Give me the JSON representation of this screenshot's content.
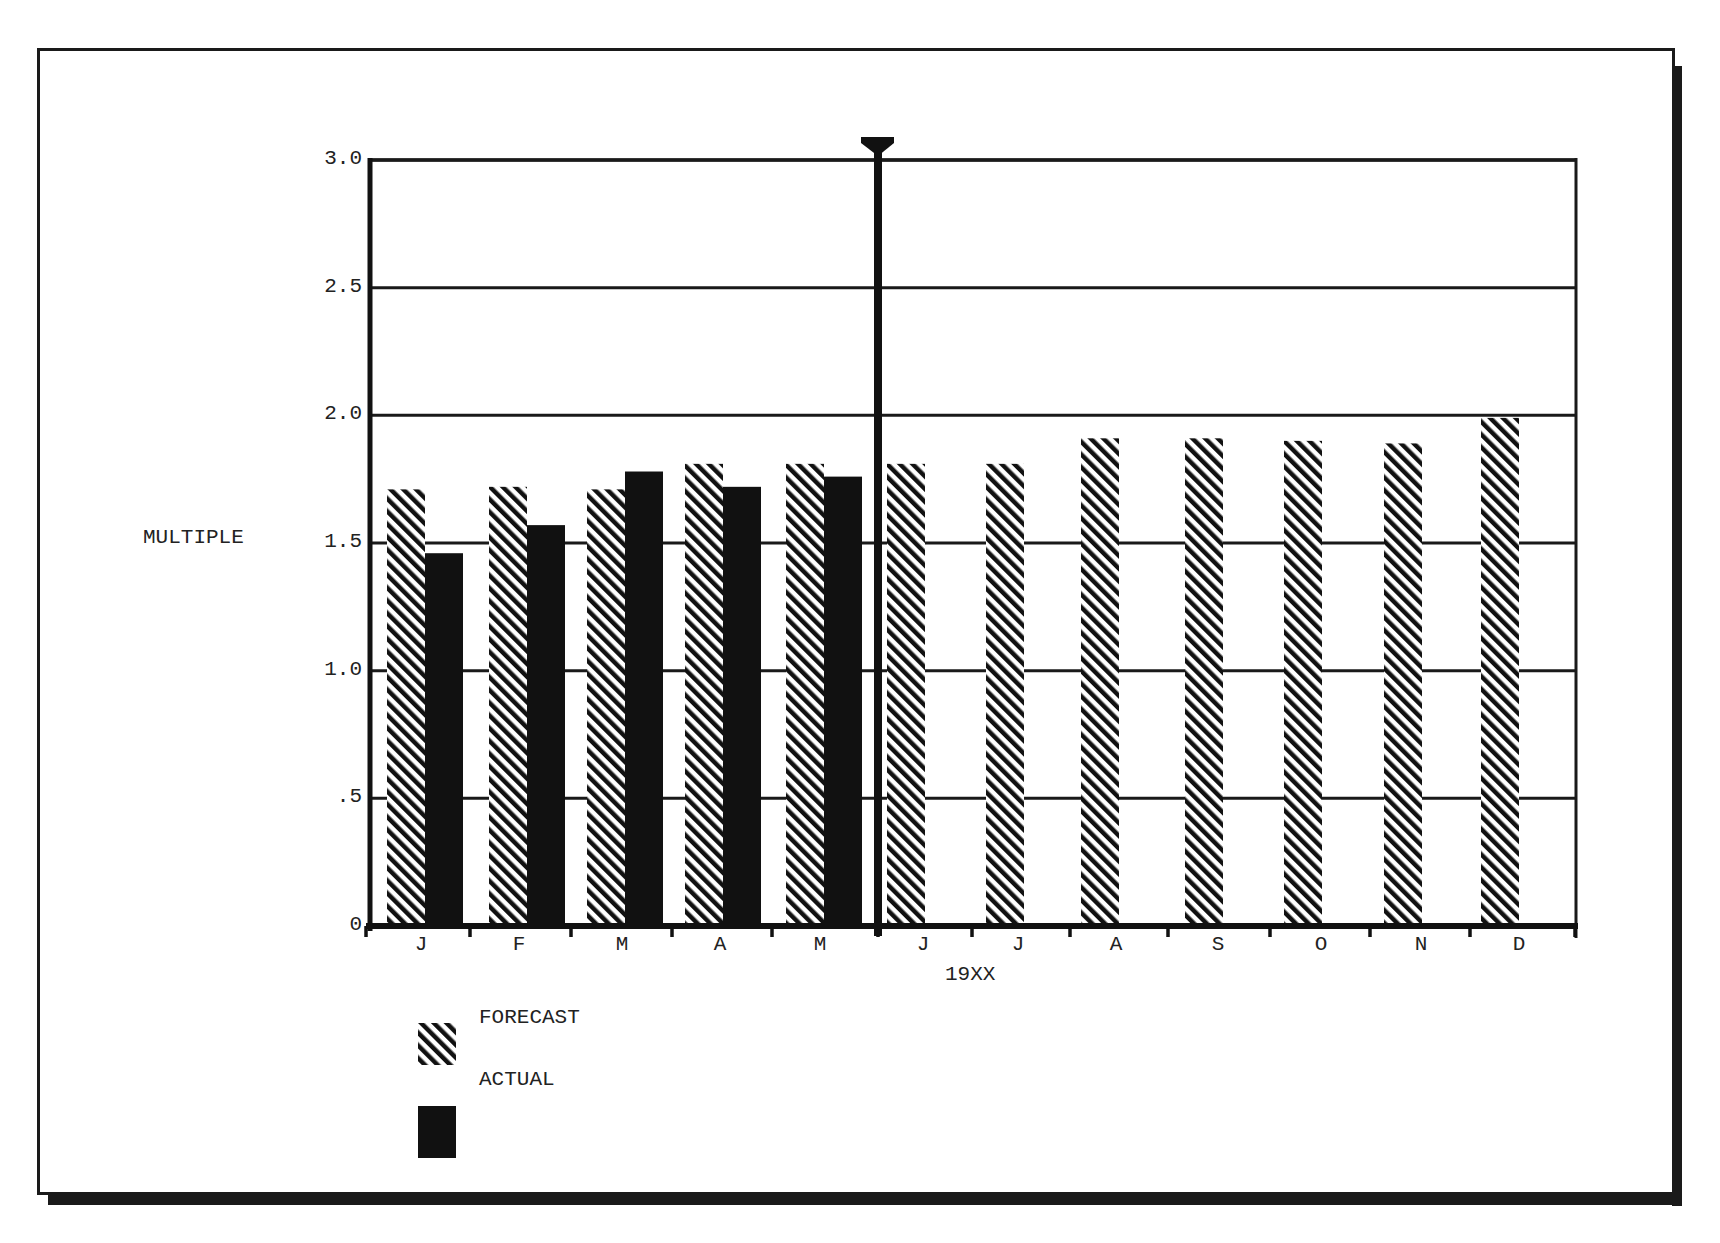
{
  "chart_data": {
    "type": "bar",
    "title": "",
    "xlabel": "19XX",
    "ylabel": "MULTIPLE",
    "ylim": [
      0,
      3.0
    ],
    "yticks": [
      "0",
      ".5",
      "1.0",
      "1.5",
      "2.0",
      "2.5",
      "3.0"
    ],
    "grid": true,
    "legend_position": "bottom-left",
    "categories": [
      "J",
      "F",
      "M",
      "A",
      "M",
      "J",
      "J",
      "A",
      "S",
      "O",
      "N",
      "D"
    ],
    "series": [
      {
        "name": "FORECAST",
        "pattern": "diagonal-hatch",
        "values": [
          1.71,
          1.72,
          1.71,
          1.81,
          1.81,
          1.81,
          1.81,
          1.91,
          1.91,
          1.9,
          1.89,
          1.99
        ]
      },
      {
        "name": "ACTUAL",
        "pattern": "solid",
        "color": "#111111",
        "values": [
          1.46,
          1.57,
          1.78,
          1.72,
          1.76,
          null,
          null,
          null,
          null,
          null,
          null,
          null
        ]
      }
    ],
    "annotations": [
      {
        "type": "vertical-marker",
        "position": "between May and June",
        "glyph": "down-arrow"
      }
    ]
  },
  "axis": {
    "ylabel": "MULTIPLE",
    "year_label": "19XX",
    "yticks": [
      {
        "label": "3.0",
        "value": 3.0
      },
      {
        "label": "2.5",
        "value": 2.5
      },
      {
        "label": "2.0",
        "value": 2.0
      },
      {
        "label": "1.5",
        "value": 1.5
      },
      {
        "label": "1.0",
        "value": 1.0
      },
      {
        "label": ".5",
        "value": 0.5
      },
      {
        "label": "0",
        "value": 0
      }
    ],
    "months": [
      "J",
      "F",
      "M",
      "A",
      "M",
      "J",
      "J",
      "A",
      "S",
      "O",
      "N",
      "D"
    ]
  },
  "legend": {
    "forecast_label": "FORECAST",
    "actual_label": "ACTUAL"
  },
  "colors": {
    "ink": "#111111",
    "background": "#ffffff"
  }
}
